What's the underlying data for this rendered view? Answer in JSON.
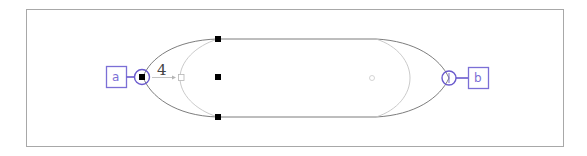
{
  "diagram": {
    "type": "shape-editor-canvas",
    "shape": "stadium / rounded capsule with bezier ends",
    "colors": {
      "frame": "#a8a8a8",
      "outer_curve": "#6e6e6e",
      "inner_curve": "#c4c4c4",
      "handle": "#000000",
      "port_accent": "#6a5acd",
      "label_accent": "#7b6fd6"
    },
    "ports": [
      {
        "id": "a",
        "label": "a",
        "side": "left",
        "selected": true
      },
      {
        "id": "b",
        "label": "b",
        "side": "right",
        "selected": false
      }
    ],
    "control_value": "4",
    "handles": [
      {
        "position": "top-left"
      },
      {
        "position": "middle-left"
      },
      {
        "position": "bottom-left"
      }
    ]
  }
}
